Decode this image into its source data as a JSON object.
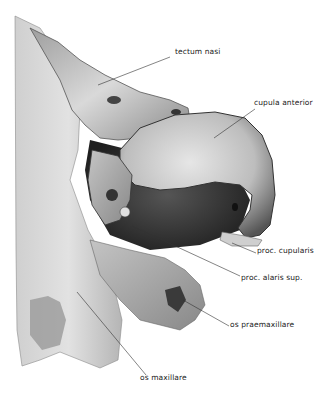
{
  "figure": {
    "colors": {
      "background": "#ffffff",
      "bone_light": "#d8d8d8",
      "bone_mid": "#a9a9a9",
      "shadow": "#2e2e2e",
      "leader": "#333333"
    }
  },
  "labels": [
    {
      "id": "tectum-nasi",
      "text": "tectum nasi",
      "x": 175,
      "y": 52,
      "line": [
        170,
        57,
        98,
        85
      ]
    },
    {
      "id": "cupula-anterior",
      "text": "cupula anterior",
      "x": 254,
      "y": 103,
      "line": [
        255,
        109,
        214,
        138
      ]
    },
    {
      "id": "proc-cupularis",
      "text": "proc. cupularis",
      "x": 257,
      "y": 251,
      "line": [
        256,
        253,
        232,
        243
      ]
    },
    {
      "id": "proc-alaris-sup",
      "text": "proc. alaris sup.",
      "x": 241,
      "y": 278,
      "line": [
        240,
        276,
        132,
        226
      ]
    },
    {
      "id": "os-praemaxillare",
      "text": "os praemaxillare",
      "x": 230,
      "y": 325,
      "line": [
        229,
        326,
        183,
        300
      ]
    },
    {
      "id": "os-maxillare",
      "text": "os maxillare",
      "x": 140,
      "y": 378,
      "line": [
        146,
        375,
        77,
        292
      ]
    }
  ]
}
